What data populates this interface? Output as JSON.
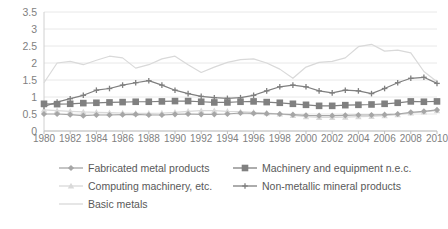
{
  "chart_data": {
    "type": "line",
    "title": "",
    "xlabel": "",
    "ylabel": "",
    "xlim": [
      1980,
      2010
    ],
    "ylim": [
      0,
      3.5
    ],
    "ytick_values": [
      0,
      0.5,
      1,
      1.5,
      2,
      2.5,
      3,
      3.5
    ],
    "ytick_labels": [
      "0",
      "0.5",
      "1",
      "1.5",
      "2",
      "2.5",
      "3",
      "3.5"
    ],
    "x": [
      1980,
      1981,
      1982,
      1983,
      1984,
      1985,
      1986,
      1987,
      1988,
      1989,
      1990,
      1991,
      1992,
      1993,
      1994,
      1995,
      1996,
      1997,
      1998,
      1999,
      2000,
      2001,
      2002,
      2003,
      2004,
      2005,
      2006,
      2007,
      2008,
      2009,
      2010
    ],
    "xtick_labels": [
      "1980",
      "1982",
      "1984",
      "1986",
      "1988",
      "1990",
      "1992",
      "1994",
      "1996",
      "1998",
      "2000",
      "2002",
      "2004",
      "2006",
      "2008",
      "2010"
    ],
    "grid": true,
    "grid_axis": "y",
    "legend_position": "bottom",
    "series": [
      {
        "name": "Fabricated metal products",
        "marker": "diamond",
        "color": "#a6a6a6",
        "values": [
          0.5,
          0.5,
          0.48,
          0.45,
          0.47,
          0.47,
          0.48,
          0.49,
          0.47,
          0.47,
          0.49,
          0.5,
          0.49,
          0.49,
          0.5,
          0.53,
          0.52,
          0.51,
          0.5,
          0.48,
          0.46,
          0.45,
          0.45,
          0.46,
          0.47,
          0.47,
          0.48,
          0.5,
          0.55,
          0.58,
          0.62
        ]
      },
      {
        "name": "Machinery and equipment n.e.c.",
        "marker": "square",
        "color": "#808080",
        "values": [
          0.8,
          0.79,
          0.8,
          0.82,
          0.83,
          0.84,
          0.85,
          0.86,
          0.86,
          0.87,
          0.88,
          0.88,
          0.86,
          0.84,
          0.84,
          0.86,
          0.87,
          0.85,
          0.83,
          0.8,
          0.77,
          0.74,
          0.74,
          0.76,
          0.77,
          0.78,
          0.8,
          0.83,
          0.87,
          0.86,
          0.87
        ]
      },
      {
        "name": "Computing machinery, etc.",
        "marker": "triangle",
        "color": "#d9d9d9",
        "values": [
          0.62,
          0.6,
          0.58,
          0.56,
          0.55,
          0.54,
          0.53,
          0.52,
          0.52,
          0.53,
          0.55,
          0.58,
          0.6,
          0.6,
          0.58,
          0.57,
          0.55,
          0.53,
          0.5,
          0.46,
          0.42,
          0.4,
          0.4,
          0.41,
          0.42,
          0.43,
          0.45,
          0.48,
          0.53,
          0.56,
          0.6
        ]
      },
      {
        "name": "Non-metallic mineral products",
        "marker": "cross",
        "color": "#7f7f7f",
        "values": [
          0.72,
          0.85,
          0.95,
          1.05,
          1.2,
          1.25,
          1.35,
          1.42,
          1.48,
          1.35,
          1.2,
          1.1,
          1.02,
          0.98,
          0.96,
          0.98,
          1.05,
          1.18,
          1.3,
          1.35,
          1.3,
          1.18,
          1.12,
          1.2,
          1.18,
          1.1,
          1.25,
          1.42,
          1.55,
          1.58,
          1.4
        ]
      },
      {
        "name": "Basic metals",
        "marker": "none",
        "color": "#d9d9d9",
        "values": [
          1.42,
          2.0,
          2.05,
          1.95,
          2.08,
          2.2,
          2.15,
          1.85,
          1.95,
          2.12,
          2.2,
          1.95,
          1.72,
          1.88,
          2.02,
          2.1,
          2.12,
          2.0,
          1.82,
          1.55,
          1.88,
          2.02,
          2.05,
          2.15,
          2.48,
          2.55,
          2.35,
          2.38,
          2.3,
          1.75,
          1.45
        ]
      }
    ]
  },
  "legend": {
    "items": [
      {
        "label": "Fabricated metal products"
      },
      {
        "label": "Machinery and equipment n.e.c."
      },
      {
        "label": "Computing machinery, etc."
      },
      {
        "label": "Non-metallic mineral products"
      },
      {
        "label": "Basic metals"
      }
    ]
  }
}
